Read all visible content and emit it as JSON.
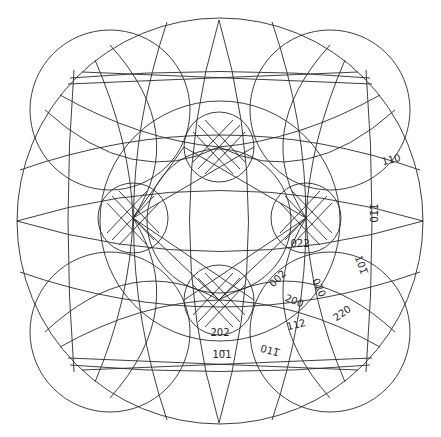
{
  "figure": {
    "type": "stereographic-projection",
    "colors": {
      "line": "#2a2a2a",
      "background": "#ffffff",
      "label": "#222222"
    },
    "projection_circle": {
      "cx": 220,
      "cy": 221,
      "r": 203
    },
    "pole_clusters": [
      {
        "name": "top",
        "cx": 219,
        "cy": 147,
        "r": 35
      },
      {
        "name": "left",
        "cx": 133,
        "cy": 218,
        "r": 35
      },
      {
        "name": "right",
        "cx": 306,
        "cy": 218,
        "r": 35
      },
      {
        "name": "bottom",
        "cx": 219,
        "cy": 300,
        "r": 35
      }
    ],
    "labels": [
      {
        "text": "110",
        "x": 392,
        "y": 163,
        "rot": -14
      },
      {
        "text": "1̄1̅0",
        "x": 370,
        "y": 213,
        "rot": 90
      },
      {
        "text": "101̅",
        "x": 358,
        "y": 266,
        "rot": 70
      },
      {
        "text": "022",
        "x": 300,
        "y": 247,
        "rot": 0
      },
      {
        "text": "002",
        "x": 280,
        "y": 281,
        "rot": -45
      },
      {
        "text": "020",
        "x": 316,
        "y": 289,
        "rot": 65
      },
      {
        "text": "200",
        "x": 293,
        "y": 304,
        "rot": 22
      },
      {
        "text": "220",
        "x": 344,
        "y": 316,
        "rot": -35
      },
      {
        "text": "112",
        "x": 297,
        "y": 328,
        "rot": -14
      },
      {
        "text": "202",
        "x": 220,
        "y": 336,
        "rot": 0
      },
      {
        "text": "10̅1",
        "x": 222,
        "y": 358,
        "rot": 0
      },
      {
        "text": "011̅",
        "x": 269,
        "y": 354,
        "rot": 15
      }
    ]
  }
}
